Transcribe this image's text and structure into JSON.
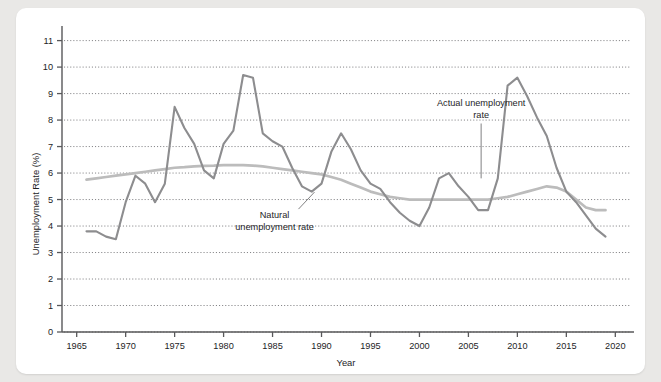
{
  "chart_data": {
    "type": "line",
    "title": "",
    "xlabel": "Year",
    "ylabel": "Unemployment Rate (%)",
    "xlim": [
      1963.5,
      2021.5
    ],
    "ylim": [
      0,
      11.4
    ],
    "xticks": [
      1965,
      1970,
      1975,
      1980,
      1985,
      1990,
      1995,
      2000,
      2005,
      2010,
      2015,
      2020
    ],
    "yticks": [
      0,
      1,
      2,
      3,
      4,
      5,
      6,
      7,
      8,
      9,
      10,
      11
    ],
    "grid": "horizontal-dotted",
    "legend": "annotations-inline",
    "x": [
      1966,
      1967,
      1968,
      1969,
      1970,
      1971,
      1972,
      1973,
      1974,
      1975,
      1976,
      1977,
      1978,
      1979,
      1980,
      1981,
      1982,
      1983,
      1984,
      1985,
      1986,
      1987,
      1988,
      1989,
      1990,
      1991,
      1992,
      1993,
      1994,
      1995,
      1996,
      1997,
      1998,
      1999,
      2000,
      2001,
      2002,
      2003,
      2004,
      2005,
      2006,
      2007,
      2008,
      2009,
      2010,
      2011,
      2012,
      2013,
      2014,
      2015,
      2016,
      2017,
      2018,
      2019
    ],
    "series": [
      {
        "name": "Actual unemployment rate",
        "color": "#8d8d8f",
        "values": [
          3.8,
          3.8,
          3.6,
          3.5,
          4.9,
          5.9,
          5.6,
          4.9,
          5.6,
          8.5,
          7.7,
          7.1,
          6.1,
          5.8,
          7.1,
          7.6,
          9.7,
          9.6,
          7.5,
          7.2,
          7.0,
          6.2,
          5.5,
          5.3,
          5.6,
          6.8,
          7.5,
          6.9,
          6.1,
          5.6,
          5.4,
          4.9,
          4.5,
          4.2,
          4.0,
          4.7,
          5.8,
          6.0,
          5.5,
          5.1,
          4.6,
          4.6,
          5.8,
          9.3,
          9.6,
          8.9,
          8.1,
          7.4,
          6.2,
          5.3,
          4.9,
          4.4,
          3.9,
          3.6
        ]
      },
      {
        "name": "Natural unemployment rate",
        "color": "#bcbcbc",
        "values": [
          5.75,
          5.8,
          5.85,
          5.9,
          5.95,
          6.0,
          6.05,
          6.1,
          6.15,
          6.2,
          6.22,
          6.25,
          6.27,
          6.28,
          6.3,
          6.3,
          6.3,
          6.28,
          6.25,
          6.2,
          6.15,
          6.1,
          6.05,
          6.0,
          5.95,
          5.85,
          5.75,
          5.6,
          5.45,
          5.3,
          5.2,
          5.1,
          5.05,
          5.0,
          5.0,
          5.0,
          5.0,
          5.0,
          5.0,
          5.0,
          5.0,
          5.0,
          5.05,
          5.1,
          5.2,
          5.3,
          5.4,
          5.5,
          5.45,
          5.3,
          5.0,
          4.7,
          4.6,
          4.6
        ]
      }
    ],
    "annotations": [
      {
        "name": "natural-label",
        "lines": [
          "Natural",
          "unemployment rate"
        ],
        "x": 1985.2,
        "y": 4.3
      },
      {
        "name": "actual-label",
        "lines": [
          "Actual unemployment",
          "rate"
        ],
        "x": 2006.3,
        "y": 8.55
      }
    ]
  },
  "axis": {
    "y_label": "Unemployment Rate (%)",
    "x_label": "Year",
    "y_tick_labels": [
      "0",
      "1",
      "2",
      "3",
      "4",
      "5",
      "6",
      "7",
      "8",
      "9",
      "10",
      "11"
    ],
    "x_tick_labels": [
      "1965",
      "1970",
      "1975",
      "1980",
      "1985",
      "1990",
      "1995",
      "2000",
      "2005",
      "2010",
      "2015",
      "2020"
    ]
  },
  "annotations": {
    "natural_line1": "Natural",
    "natural_line2": "unemployment rate",
    "actual_line1": "Actual unemployment",
    "actual_line2": "rate"
  },
  "colors": {
    "actual": "#8d8d8f",
    "natural": "#bcbcbc",
    "axis": "#58585a",
    "grid": "#6f6f72",
    "background": "#ffffff",
    "page": "#e9e8e6"
  }
}
